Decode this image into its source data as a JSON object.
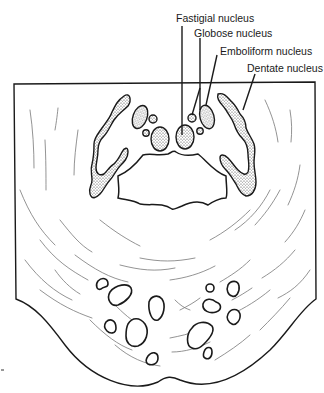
{
  "figure": {
    "labels": [
      {
        "id": "fastigial",
        "text": "Fastigial nucleus"
      },
      {
        "id": "globose",
        "text": "Globose nucleus"
      },
      {
        "id": "emboliform",
        "text": "Emboliform nucleus"
      },
      {
        "id": "dentate",
        "text": "Dentate nucleus"
      }
    ],
    "colors": {
      "line": "#1a1a1a",
      "fiber": "#777777",
      "background": "#ffffff"
    }
  }
}
